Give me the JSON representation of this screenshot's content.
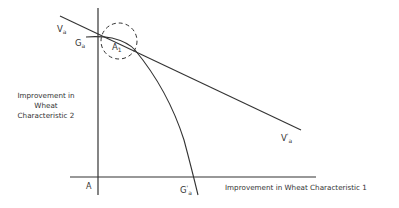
{
  "diagram": {
    "axes": {
      "origin_label": "A",
      "x_axis_label": "Improvement in Wheat Characteristic 1",
      "y_axis_label_lines": [
        "Improvement in",
        "Wheat",
        "Characteristic 2"
      ]
    },
    "curves": {
      "value_line": {
        "label_start": "V",
        "label_start_sub": "a",
        "label_end": "V",
        "label_end_sup": "'",
        "label_end_sub": "a"
      },
      "frontier_curve": {
        "label_start": "G",
        "label_start_sub": "a",
        "label_end": "G",
        "label_end_sup": "'",
        "label_end_sub": "a"
      },
      "tangency_point": {
        "label": "A",
        "label_sub": "1"
      }
    },
    "colors": {
      "line": "#333333",
      "background": "#ffffff"
    }
  }
}
